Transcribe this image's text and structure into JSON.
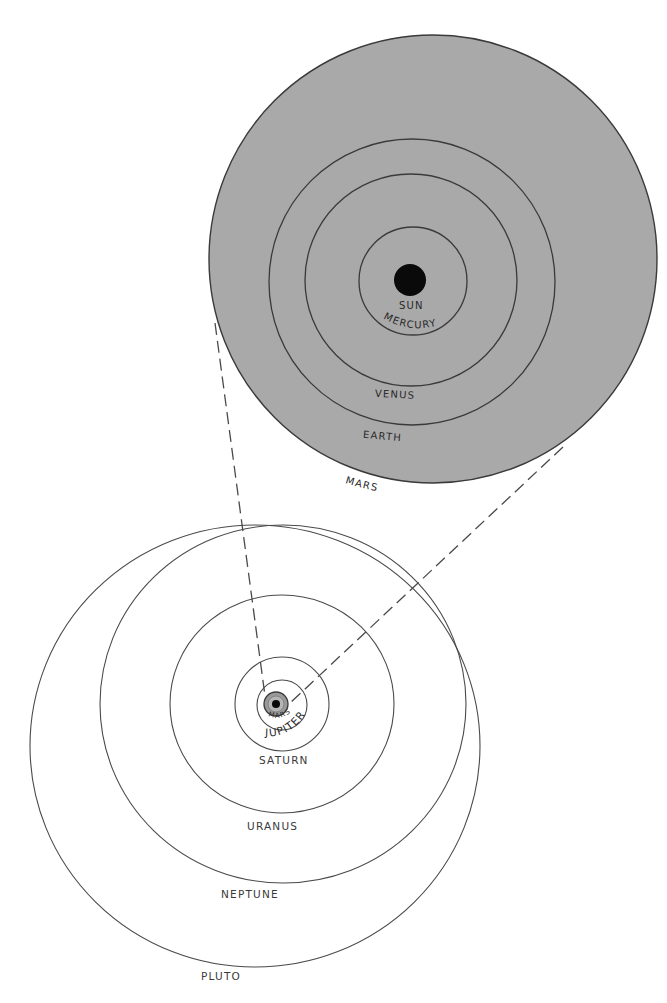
{
  "figure": {
    "colors": {
      "background": "#ffffff",
      "inner_system_fill": "#a9a9a9",
      "line": "#3a3a3a",
      "sun": "#0a0a0a"
    },
    "inner_system": {
      "labels": {
        "sun": "SUN",
        "mercury": "MERCURY",
        "venus": "VENUS",
        "earth": "EARTH",
        "mars": "MARS"
      }
    },
    "outer_system": {
      "labels": {
        "mars": "MARS",
        "jupiter": "JUPITER",
        "saturn": "SATURN",
        "uranus": "URANUS",
        "neptune": "NEPTUNE",
        "pluto": "PLUTO"
      }
    },
    "magnification_lines": {
      "style": "dashed",
      "count": 2
    }
  }
}
